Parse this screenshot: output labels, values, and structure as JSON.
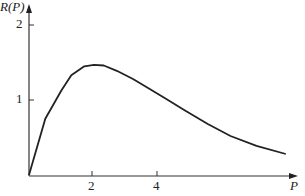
{
  "chart_data": {
    "type": "line",
    "title": "",
    "xlabel": "P",
    "ylabel": "R(P)",
    "x_ticks": [
      "2",
      "4"
    ],
    "y_ticks": [
      "1",
      "2"
    ],
    "xlim": [
      0,
      8.3
    ],
    "ylim": [
      0,
      2.2
    ],
    "grid": false,
    "series": [
      {
        "name": "R(P)",
        "x": [
          0,
          0.5,
          1.0,
          1.3,
          1.7,
          2.0,
          2.3,
          2.7,
          3.2,
          3.7,
          4.2,
          4.8,
          5.5,
          6.2,
          7.0,
          7.9
        ],
        "y": [
          0,
          0.75,
          1.13,
          1.33,
          1.45,
          1.47,
          1.46,
          1.39,
          1.28,
          1.15,
          1.02,
          0.86,
          0.68,
          0.52,
          0.39,
          0.28
        ]
      }
    ]
  }
}
